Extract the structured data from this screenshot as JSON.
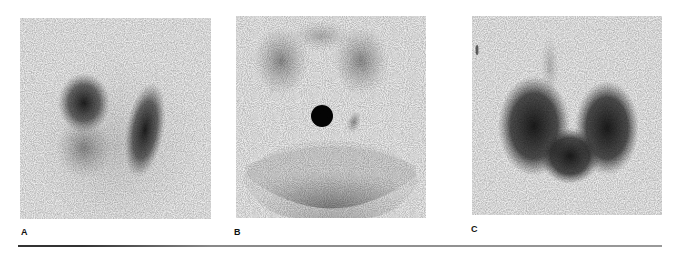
{
  "figure": {
    "panels": [
      {
        "id": "A",
        "label": "A",
        "description": "scintigraphy image with two dark lobes (left lobe denser upper pole)"
      },
      {
        "id": "B",
        "label": "B",
        "description": "scintigraphy image with small dark focal nodule, faint salivary glands above, circular field of view"
      },
      {
        "id": "C",
        "label": "C",
        "description": "scintigraphy image with enlarged dark bilobed gland"
      }
    ],
    "colors": {
      "background": "#ffffff",
      "panel_bg": "#ececec",
      "uptake": "#1a1a1a"
    }
  }
}
